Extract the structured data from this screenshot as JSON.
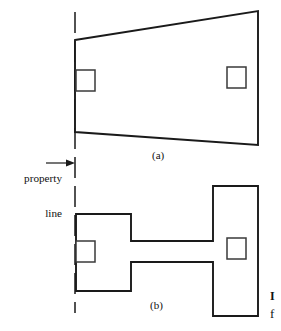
{
  "figure": {
    "colors": {
      "outline": "#1a1a1a",
      "opening": "#3a3a3a",
      "background": "#ffffff",
      "text": "#111111"
    },
    "annotations": {
      "property_line_label_line1": "property",
      "property_line_label_line2": "line",
      "caption_a": "(a)",
      "caption_b": "(b)",
      "edge_glyph_1": "I",
      "edge_glyph_2": "f"
    },
    "property_line": {
      "name": "property-line",
      "orientation": "vertical",
      "x": 75,
      "y_top": 12,
      "y_bottom": 313,
      "style": "dashed"
    },
    "leader": {
      "x_start": 46,
      "x_end": 74,
      "y": 163,
      "arrow": "right"
    },
    "shape_a": {
      "name": "trapezoid-lot",
      "type": "polygon",
      "points": "75,40 258,11 258,145 75,132",
      "openings": [
        {
          "name": "opening-a-left",
          "x": 76,
          "y": 70,
          "width": 19,
          "height": 21
        },
        {
          "name": "opening-a-right",
          "x": 227,
          "y": 67,
          "width": 19,
          "height": 21
        }
      ]
    },
    "shape_b": {
      "name": "dumbbell-lot",
      "type": "polygon",
      "points": "76,214 131,214 131,241 213,241 213,186 258,186 258,316 213,316 213,262 131,262 131,291 76,291",
      "openings": [
        {
          "name": "opening-b-left",
          "x": 76,
          "y": 241,
          "width": 19,
          "height": 21
        },
        {
          "name": "opening-b-right",
          "x": 227,
          "y": 238,
          "width": 19,
          "height": 21
        }
      ]
    }
  }
}
